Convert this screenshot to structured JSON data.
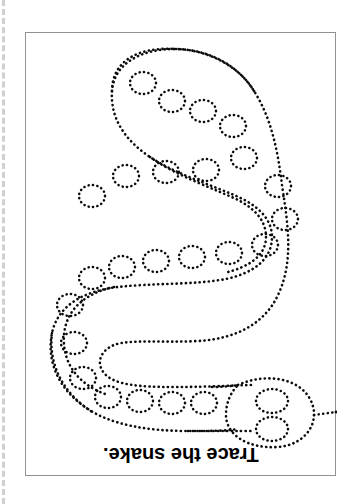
{
  "page": {
    "title": "Trace the snake.",
    "background_color": "#ffffff",
    "width": 357,
    "height": 504
  },
  "cut_guide": {
    "name": "dashed-cut-line",
    "color": "#d0d0d0",
    "orientation": "vertical",
    "position": "left-edge"
  },
  "frame": {
    "border_color": "#8f9194",
    "fill_color": "#ffffff",
    "x": 25,
    "y": 32,
    "width": 311,
    "height": 444
  },
  "caption": {
    "text": "Trace the snake.",
    "rotation_degrees": 180,
    "weight": "bold",
    "size_px": 20,
    "color": "#000000"
  },
  "figure": {
    "subject": "snake",
    "style": "dotted-outline-tracing",
    "dot_color": "#0b0b0b",
    "dot_stroke_width": 2.6,
    "dot_gap": 4.4,
    "parts": {
      "body_outline": "closed serpentine band",
      "tail": "rounded cap, top-center",
      "head": "bulbous oval, lower-right",
      "eyes": 2,
      "tongue": "forked, pointing right",
      "spots": 26
    }
  },
  "chart_data": {
    "type": "scatter",
    "title": "Trace the snake.",
    "xlabel": "",
    "ylabel": "",
    "spots": [
      {
        "cx": 117,
        "cy": 50,
        "rx": 13,
        "ry": 11
      },
      {
        "cx": 146,
        "cy": 68,
        "rx": 13,
        "ry": 11
      },
      {
        "cx": 177,
        "cy": 78,
        "rx": 13,
        "ry": 11
      },
      {
        "cx": 207,
        "cy": 93,
        "rx": 13,
        "ry": 11
      },
      {
        "cx": 218,
        "cy": 125,
        "rx": 13,
        "ry": 11
      },
      {
        "cx": 180,
        "cy": 137,
        "rx": 13,
        "ry": 11
      },
      {
        "cx": 140,
        "cy": 139,
        "rx": 13,
        "ry": 11
      },
      {
        "cx": 100,
        "cy": 143,
        "rx": 13,
        "ry": 11
      },
      {
        "cx": 66,
        "cy": 163,
        "rx": 13,
        "ry": 11
      },
      {
        "cx": 252,
        "cy": 153,
        "rx": 13,
        "ry": 11
      },
      {
        "cx": 259,
        "cy": 186,
        "rx": 13,
        "ry": 11
      },
      {
        "cx": 239,
        "cy": 212,
        "rx": 13,
        "ry": 11
      },
      {
        "cx": 203,
        "cy": 220,
        "rx": 13,
        "ry": 11
      },
      {
        "cx": 166,
        "cy": 224,
        "rx": 13,
        "ry": 11
      },
      {
        "cx": 130,
        "cy": 228,
        "rx": 13,
        "ry": 11
      },
      {
        "cx": 96,
        "cy": 234,
        "rx": 13,
        "ry": 11
      },
      {
        "cx": 66,
        "cy": 245,
        "rx": 13,
        "ry": 11
      },
      {
        "cx": 44,
        "cy": 272,
        "rx": 13,
        "ry": 11
      },
      {
        "cx": 48,
        "cy": 310,
        "rx": 13,
        "ry": 11
      },
      {
        "cx": 57,
        "cy": 345,
        "rx": 13,
        "ry": 11
      },
      {
        "cx": 82,
        "cy": 364,
        "rx": 13,
        "ry": 11
      },
      {
        "cx": 114,
        "cy": 368,
        "rx": 13,
        "ry": 11
      },
      {
        "cx": 146,
        "cy": 370,
        "rx": 13,
        "ry": 11
      },
      {
        "cx": 178,
        "cy": 370,
        "rx": 13,
        "ry": 11
      },
      {
        "cx": 246,
        "cy": 352,
        "rx": 15,
        "ry": 12
      },
      {
        "cx": 246,
        "cy": 382,
        "rx": 15,
        "ry": 12
      }
    ]
  }
}
